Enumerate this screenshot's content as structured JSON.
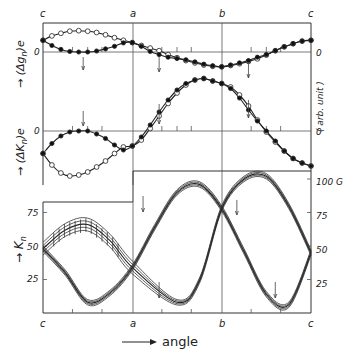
{
  "chart_data": [
    {
      "type": "scatter",
      "panel": "upper-delta-g",
      "ylabel": "(Δg_n)_e",
      "y_right_label": "(arb. unit)",
      "zero_label": "0",
      "x_tick_labels": [
        "c",
        "a",
        "b",
        "c"
      ],
      "series": [
        {
          "name": "open circles",
          "marker": "open-circle",
          "x": [
            0,
            0.1,
            0.2,
            0.3,
            0.4,
            0.5,
            0.6,
            0.7,
            0.8,
            0.9,
            1.0,
            1.1,
            1.2,
            1.3,
            1.4,
            1.5,
            1.6,
            1.7,
            1.8,
            1.9,
            2.0,
            2.1,
            2.2,
            2.3,
            2.4,
            2.5,
            2.6,
            2.7,
            2.8,
            2.9,
            3.0
          ],
          "y": [
            0.45,
            0.62,
            0.72,
            0.8,
            0.82,
            0.8,
            0.75,
            0.66,
            0.55,
            0.45,
            0.36,
            0.25,
            0.15,
            0.05,
            -0.1,
            -0.22,
            -0.33,
            -0.42,
            -0.5,
            -0.55,
            -0.57,
            -0.52,
            -0.45,
            -0.36,
            -0.26,
            -0.12,
            0.05,
            0.2,
            0.32,
            0.42,
            0.45
          ]
        },
        {
          "name": "filled circles",
          "marker": "filled-circle",
          "x": [
            0,
            0.1,
            0.2,
            0.3,
            0.4,
            0.5,
            0.6,
            0.7,
            0.8,
            0.9,
            1.0,
            1.1,
            1.2,
            1.3,
            1.4,
            1.5,
            1.6,
            1.7,
            1.8,
            1.9,
            2.0,
            2.1,
            2.2,
            2.3,
            2.4,
            2.5,
            2.6,
            2.7,
            2.8,
            2.9,
            3.0
          ],
          "y": [
            0.45,
            0.25,
            0.1,
            0.02,
            0.0,
            0.0,
            0.04,
            0.12,
            0.22,
            0.35,
            0.36,
            0.22,
            0.02,
            -0.1,
            -0.2,
            -0.25,
            -0.3,
            -0.38,
            -0.47,
            -0.53,
            -0.57,
            -0.5,
            -0.42,
            -0.33,
            -0.2,
            -0.1,
            0.05,
            0.2,
            0.32,
            0.42,
            0.45
          ]
        }
      ]
    },
    {
      "type": "scatter",
      "panel": "upper-delta-K",
      "ylabel": "(ΔK_n)_e",
      "zero_label": "0",
      "series": [
        {
          "name": "open circles",
          "marker": "open-circle",
          "x": [
            0,
            0.1,
            0.2,
            0.3,
            0.4,
            0.5,
            0.6,
            0.7,
            0.8,
            0.9,
            1.0,
            1.1,
            1.2,
            1.3,
            1.4,
            1.5,
            1.6,
            1.7,
            1.8,
            1.9,
            2.0,
            2.1,
            2.2,
            2.3,
            2.4,
            2.5,
            2.6,
            2.7,
            2.8,
            2.9,
            3.0
          ],
          "y": [
            -0.45,
            -0.68,
            -0.84,
            -0.9,
            -0.88,
            -0.82,
            -0.72,
            -0.6,
            -0.45,
            -0.32,
            -0.3,
            -0.18,
            0.05,
            0.3,
            0.55,
            0.76,
            0.92,
            1.02,
            1.05,
            1.0,
            0.95,
            0.88,
            0.72,
            0.5,
            0.22,
            -0.02,
            -0.22,
            -0.4,
            -0.55,
            -0.64,
            -0.7
          ]
        },
        {
          "name": "filled circles",
          "marker": "filled-circle",
          "x": [
            0,
            0.1,
            0.2,
            0.3,
            0.4,
            0.5,
            0.6,
            0.7,
            0.8,
            0.9,
            1.0,
            1.1,
            1.2,
            1.3,
            1.4,
            1.5,
            1.6,
            1.7,
            1.8,
            1.9,
            2.0,
            2.1,
            2.2,
            2.3,
            2.4,
            2.5,
            2.6,
            2.7,
            2.8,
            2.9,
            3.0
          ],
          "y": [
            -0.45,
            -0.25,
            -0.1,
            -0.02,
            0.0,
            0.0,
            -0.06,
            -0.15,
            -0.28,
            -0.38,
            -0.3,
            -0.12,
            0.12,
            0.38,
            0.62,
            0.82,
            0.95,
            1.02,
            1.05,
            1.0,
            0.95,
            0.85,
            0.66,
            0.42,
            0.2,
            0.0,
            -0.2,
            -0.4,
            -0.55,
            -0.64,
            -0.7
          ]
        }
      ]
    },
    {
      "type": "line",
      "panel": "lower-K",
      "ylabel": "K_n",
      "xlabel": "angle",
      "unit": "G",
      "x_tick_labels": [
        "c",
        "a",
        "b",
        "c"
      ],
      "left_y_ticks": [
        25,
        50,
        75
      ],
      "right_y_ticks": [
        25,
        50,
        75,
        100
      ],
      "right_y_tick_labels": [
        "25",
        "50",
        "75",
        "100 G"
      ],
      "series": [
        {
          "name": "branch 1",
          "x": [
            0,
            0.25,
            0.5,
            0.75,
            1.0,
            1.25,
            1.5,
            1.75,
            2.0,
            2.25,
            2.5,
            2.75,
            3.0
          ],
          "y": [
            48,
            62,
            66,
            57,
            34,
            14,
            45,
            80,
            92,
            77,
            44,
            12,
            45
          ]
        },
        {
          "name": "branch 2",
          "x": [
            0,
            0.25,
            0.5,
            0.75,
            1.0,
            1.25,
            1.5,
            1.75,
            2.0,
            2.25,
            2.5,
            2.75,
            3.0
          ],
          "y": [
            48,
            22,
            5,
            12,
            34,
            62,
            92,
            98,
            80,
            100,
            104,
            78,
            45
          ]
        }
      ]
    }
  ],
  "labels": {
    "top_x": [
      "c",
      "a",
      "b",
      "c"
    ],
    "bottom_x": [
      "c",
      "a",
      "b",
      "c"
    ],
    "delta_g": "(Δg",
    "delta_g_sub": "n",
    "delta_g_close": ")e",
    "delta_K": "(ΔK",
    "delta_K_sub": "n",
    "delta_K_close": ")e",
    "K": "K",
    "K_sub": "n",
    "arb_unit": "( arb. unit )",
    "zero": "0",
    "angle": "angle",
    "ticks_left": [
      "75",
      "50",
      "25"
    ],
    "ticks_right": [
      "100 G",
      "75",
      "50",
      "25"
    ]
  }
}
